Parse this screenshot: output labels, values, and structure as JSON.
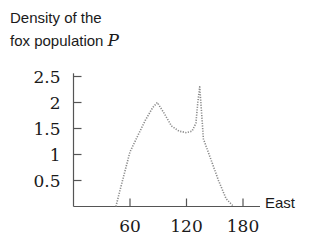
{
  "chart_data": {
    "type": "line",
    "title": "Density of the fox population P",
    "title_lines": [
      "Density of the",
      "fox population "
    ],
    "title_variable": "P",
    "xlabel": "East",
    "ylabel": "Density of the fox population P",
    "xlim": [
      0,
      190
    ],
    "ylim": [
      0,
      2.6
    ],
    "xticks": [
      60,
      120,
      180
    ],
    "xtick_labels": [
      "60",
      "120",
      "180"
    ],
    "yticks": [
      0.5,
      1,
      1.5,
      2,
      2.5
    ],
    "ytick_labels": [
      "0.5",
      "1",
      "1.5",
      "2",
      "2.5"
    ],
    "grid": false,
    "legend": null,
    "line_style": "dotted",
    "line_color": "#8a8a8a",
    "axis_color": "#555555",
    "series": [
      {
        "name": "P",
        "x": [
          45,
          52,
          60,
          68,
          76,
          84,
          89,
          96,
          104,
          112,
          120,
          126,
          130,
          132,
          134,
          136,
          138,
          140,
          146,
          154,
          162,
          170
        ],
        "y": [
          0,
          0.5,
          1.05,
          1.35,
          1.65,
          1.9,
          2.0,
          1.8,
          1.55,
          1.45,
          1.42,
          1.45,
          1.6,
          2.0,
          2.3,
          1.8,
          1.3,
          1.2,
          0.9,
          0.5,
          0.15,
          0
        ]
      }
    ]
  }
}
